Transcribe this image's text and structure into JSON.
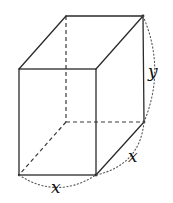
{
  "figure": {
    "type": "rectangular-prism",
    "labels": {
      "height": "y",
      "depth": "x",
      "width": "x"
    },
    "colors": {
      "edges": "#2a2a2a",
      "hidden_edges": "#3a3a3a",
      "dimension_arcs": "#555555",
      "labels": "#111111",
      "background": "#ffffff"
    }
  }
}
